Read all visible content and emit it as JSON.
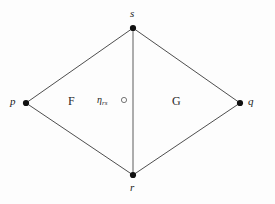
{
  "figure": {
    "type": "planar-graph-diagram",
    "background_color": "#fdfdfd",
    "stroke_color": "#3a3a3a",
    "vertex_color": "#111111",
    "width": 275,
    "height": 204,
    "vertices": [
      {
        "id": "s",
        "label": "s",
        "x": 133,
        "y": 28,
        "label_x": 130,
        "label_y": 8
      },
      {
        "id": "p",
        "label": "p",
        "x": 26,
        "y": 103,
        "label_x": 10,
        "label_y": 96
      },
      {
        "id": "q",
        "label": "q",
        "x": 240,
        "y": 103,
        "label_x": 248,
        "label_y": 96
      },
      {
        "id": "r",
        "label": "r",
        "x": 133,
        "y": 175,
        "label_x": 130,
        "label_y": 182
      }
    ],
    "edges": [
      {
        "from": "p",
        "to": "s",
        "name": "edge-p-s"
      },
      {
        "from": "s",
        "to": "q",
        "name": "edge-s-q"
      },
      {
        "from": "q",
        "to": "r",
        "name": "edge-q-r"
      },
      {
        "from": "r",
        "to": "p",
        "name": "edge-r-p"
      },
      {
        "from": "s",
        "to": "r",
        "name": "edge-s-r"
      }
    ],
    "faces": [
      {
        "id": "F",
        "label": "F",
        "x": 68,
        "y": 95
      },
      {
        "id": "G",
        "label": "G",
        "x": 172,
        "y": 95
      }
    ],
    "annotations": [
      {
        "id": "eta-rs",
        "symbol": "η",
        "subscript": "rs",
        "x": 97,
        "y": 95,
        "marker": {
          "type": "open-circle",
          "x": 124,
          "y": 100,
          "radius": 2.6
        }
      }
    ]
  }
}
